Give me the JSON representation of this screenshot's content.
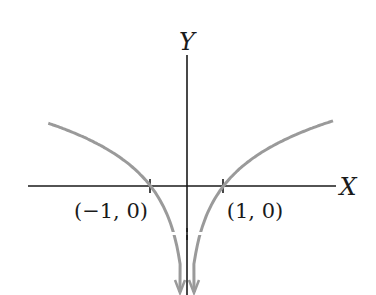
{
  "chart_data": {
    "type": "line",
    "title": "",
    "function": "y = ln|x|",
    "xlabel": "X",
    "ylabel": "Y",
    "xlim": [
      -4.1,
      4.2
    ],
    "ylim": [
      -2.4,
      2.6
    ],
    "grid": false,
    "legend": null,
    "ticks": [
      {
        "x": -1,
        "label": "(−1, 0)"
      },
      {
        "x": 1,
        "label": "(1, 0)"
      }
    ],
    "series": [
      {
        "name": "left branch",
        "x": [
          -3.8,
          -3.0,
          -2.5,
          -2.0,
          -1.5,
          -1.0,
          -0.7,
          -0.5,
          -0.35,
          -0.25,
          -0.19
        ],
        "values": [
          1.34,
          1.1,
          0.92,
          0.69,
          0.41,
          0.0,
          -0.36,
          -0.69,
          -1.05,
          -1.39,
          -1.66
        ],
        "asymptote_arrow": "down"
      },
      {
        "name": "right branch",
        "x": [
          0.19,
          0.25,
          0.35,
          0.5,
          0.7,
          1.0,
          1.5,
          2.0,
          2.5,
          3.0,
          4.0
        ],
        "values": [
          -1.66,
          -1.39,
          -1.05,
          -0.69,
          -0.36,
          0.0,
          0.41,
          0.69,
          0.92,
          1.1,
          1.39
        ],
        "asymptote_arrow": "down"
      }
    ],
    "colors": {
      "curve": "#9a9a9a",
      "axes": "#1a1a1a"
    }
  }
}
